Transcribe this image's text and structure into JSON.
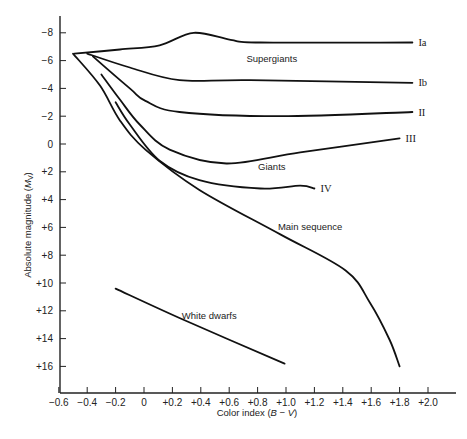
{
  "chart_data": {
    "type": "line",
    "title": "",
    "xlabel": "Color index (B − V)",
    "ylabel": "Absolute magnitude (M_V)",
    "xlim": [
      -0.6,
      2.2
    ],
    "ylim": [
      18,
      -9.2
    ],
    "y_inverted": true,
    "grid": false,
    "x_ticks": [
      -0.6,
      -0.4,
      -0.2,
      0,
      0.2,
      0.4,
      0.6,
      0.8,
      1.0,
      1.2,
      1.4,
      1.6,
      1.8,
      2.0
    ],
    "x_tick_labels": [
      "−0.6",
      "−0.4",
      "−0.2",
      "0",
      "+0.2",
      "+0.4",
      "+0.6",
      "+0.8",
      "+1.0",
      "+1.2",
      "+1.4",
      "+1.6",
      "+1.8",
      "+2.0"
    ],
    "y_ticks": [
      -8,
      -6,
      -4,
      -2,
      0,
      2,
      4,
      6,
      8,
      10,
      12,
      14,
      16
    ],
    "y_tick_labels": [
      "−8",
      "−6",
      "−4",
      "−2",
      "0",
      "+2",
      "+4",
      "+6",
      "+8",
      "+10",
      "+12",
      "+14",
      "+16"
    ],
    "series": [
      {
        "name": "Ia",
        "label": "Ia",
        "x": [
          -0.49,
          -0.17,
          0.11,
          0.35,
          0.61,
          0.82,
          1.89
        ],
        "y": [
          -6.5,
          -6.8,
          -7.1,
          -8.0,
          -7.5,
          -7.3,
          -7.3
        ]
      },
      {
        "name": "Ib",
        "label": "Ib",
        "x": [
          -0.4,
          -0.1,
          0.25,
          0.75,
          1.89
        ],
        "y": [
          -6.5,
          -5.5,
          -4.6,
          -4.6,
          -4.4
        ]
      },
      {
        "name": "II",
        "label": "II",
        "x": [
          -0.36,
          -0.1,
          0.01,
          0.25,
          0.96,
          1.89
        ],
        "y": [
          -6.3,
          -4.0,
          -3.1,
          -2.3,
          -2.0,
          -2.3
        ]
      },
      {
        "name": "III",
        "label": "III",
        "x": [
          -0.3,
          -0.17,
          -0.03,
          0.18,
          0.58,
          1.1,
          1.8
        ],
        "y": [
          -5.0,
          -3.2,
          -1.4,
          0.4,
          1.4,
          0.6,
          -0.4
        ]
      },
      {
        "name": "IV",
        "label": "IV",
        "x": [
          -0.2,
          -0.1,
          0.11,
          0.39,
          0.82,
          1.1,
          1.2
        ],
        "y": [
          -3.0,
          -1.4,
          1.2,
          2.6,
          3.2,
          3.0,
          3.2
        ]
      },
      {
        "name": "Main sequence",
        "label": "",
        "x": [
          -0.5,
          -0.31,
          -0.17,
          0.01,
          0.39,
          0.96,
          1.42,
          1.59,
          1.73,
          1.8
        ],
        "y": [
          -6.5,
          -4.2,
          -1.7,
          0.4,
          3.3,
          6.5,
          9.1,
          11.4,
          14.1,
          16.0
        ]
      },
      {
        "name": "White dwarfs",
        "label": "",
        "x": [
          -0.2,
          0.29,
          0.99
        ],
        "y": [
          10.4,
          12.7,
          15.8
        ]
      }
    ],
    "annotations": [
      {
        "text": "Supergiants",
        "x": 0.9,
        "y": -5.9
      },
      {
        "text": "Giants",
        "x": 0.9,
        "y": 1.9
      },
      {
        "text": "Main sequence",
        "x": 1.17,
        "y": 6.2
      },
      {
        "text": "White dwarfs",
        "x": 0.46,
        "y": 12.6
      }
    ]
  },
  "labels": {
    "xlabel_text": "Color index (",
    "xlabel_italic": "B",
    "xlabel_mid": " − ",
    "xlabel_italic2": "V",
    "xlabel_end": ")",
    "ylabel_text": "Absolute magnitude (",
    "ylabel_italic": "M",
    "ylabel_sub": "V",
    "ylabel_end": ")"
  }
}
